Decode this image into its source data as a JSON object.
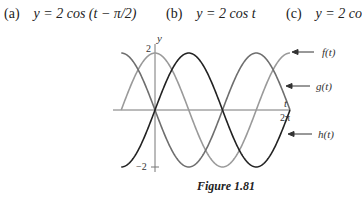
{
  "options": [
    {
      "label": "(a)",
      "equation": "y = 2 cos (t − π/2)"
    },
    {
      "label": "(b)",
      "equation": "y = 2 cos t"
    },
    {
      "label": "(c)",
      "equation": "y = 2 co"
    }
  ],
  "figure": {
    "caption": "Figure 1.81",
    "y_axis_label": "y",
    "x_axis_label": "t",
    "y_tick_top": "2",
    "y_tick_bottom": "−2",
    "x_tick_end": "2π",
    "curve_labels": {
      "f": "f(t)",
      "g": "g(t)",
      "h": "h(t)"
    }
  },
  "chart_data": {
    "type": "line",
    "title": "Figure 1.81",
    "xlabel": "t",
    "ylabel": "y",
    "xlim": [
      -1.5708,
      6.2832
    ],
    "ylim": [
      -2,
      2
    ],
    "x_ticks": [
      "2π"
    ],
    "y_ticks": [
      "2",
      "−2"
    ],
    "grid": false,
    "series": [
      {
        "name": "f(t)",
        "formula": "2cos(t)",
        "color": "#9a9a9a",
        "x": [
          "-π/2",
          "0",
          "π/2",
          "π",
          "3π/2",
          "2π"
        ],
        "values": [
          0,
          2,
          0,
          -2,
          0,
          2
        ]
      },
      {
        "name": "g(t)",
        "formula": "-2sin(t)",
        "color": "#6e6e6e",
        "x": [
          "-π/2",
          "0",
          "π/2",
          "π",
          "3π/2",
          "2π"
        ],
        "values": [
          2,
          0,
          -2,
          0,
          2,
          0
        ]
      },
      {
        "name": "h(t)",
        "formula": "2sin(t)",
        "color": "#222222",
        "x": [
          "-π/2",
          "0",
          "π/2",
          "π",
          "3π/2",
          "2π"
        ],
        "values": [
          -2,
          0,
          2,
          0,
          -2,
          0
        ]
      }
    ]
  }
}
